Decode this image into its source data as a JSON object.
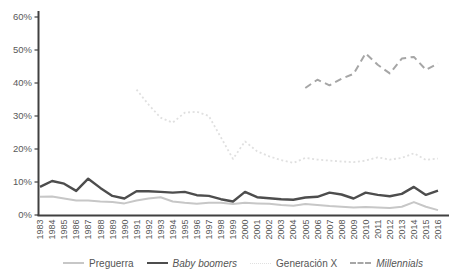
{
  "chart_data": {
    "type": "line",
    "title": "",
    "xlabel": "",
    "ylabel": "",
    "ylim": [
      0,
      60
    ],
    "grid": false,
    "legend_position": "bottom-center",
    "axis_color": "#404040",
    "tick_label_color": "#595959",
    "background": "#ffffff",
    "yticks": [
      "0%",
      "10%",
      "20%",
      "30%",
      "40%",
      "50%",
      "60%"
    ],
    "x": [
      1983,
      1984,
      1985,
      1986,
      1987,
      1988,
      1989,
      1990,
      1991,
      1992,
      1993,
      1994,
      1995,
      1996,
      1997,
      1998,
      1999,
      2000,
      2001,
      2002,
      2003,
      2004,
      2005,
      2006,
      2007,
      2008,
      2009,
      2010,
      2011,
      2012,
      2013,
      2014,
      2015,
      2016
    ],
    "series": [
      {
        "name": "Preguerra",
        "color": "#c7c7c7",
        "style": "solid",
        "width": 2,
        "italic": false,
        "values": [
          5.5,
          5.6,
          5.0,
          4.4,
          4.4,
          4.1,
          3.9,
          3.5,
          4.4,
          5.0,
          5.4,
          4.1,
          3.7,
          3.4,
          3.7,
          3.7,
          3.3,
          3.7,
          3.5,
          3.4,
          3.0,
          2.8,
          3.3,
          3.0,
          2.7,
          2.5,
          2.3,
          2.4,
          2.3,
          2.1,
          2.5,
          3.9,
          2.5,
          1.5
        ]
      },
      {
        "name": "Baby boomers",
        "color": "#4d4d4d",
        "style": "solid",
        "width": 2.4,
        "italic": true,
        "values": [
          8.5,
          10.3,
          9.5,
          7.3,
          11.0,
          8.2,
          5.8,
          5.0,
          7.2,
          7.2,
          7.0,
          6.8,
          7.0,
          6.0,
          5.8,
          4.8,
          4.1,
          7.0,
          5.4,
          5.1,
          4.8,
          4.6,
          5.3,
          5.5,
          6.8,
          6.2,
          5.0,
          6.8,
          6.1,
          5.7,
          6.4,
          8.5,
          6.1,
          7.4
        ]
      },
      {
        "name": "Generación X",
        "color": "#e0e0e0",
        "style": "dotted",
        "width": 1.8,
        "italic": false,
        "values": [
          null,
          null,
          null,
          null,
          null,
          null,
          null,
          null,
          38.0,
          33.5,
          29.5,
          28.0,
          31.0,
          31.3,
          30.0,
          23.5,
          17.0,
          22.3,
          19.3,
          17.8,
          16.6,
          15.8,
          17.3,
          16.8,
          16.5,
          16.2,
          16.0,
          16.5,
          17.5,
          16.8,
          17.3,
          18.7,
          16.7,
          17.1
        ]
      },
      {
        "name": "Millennials",
        "color": "#a6a6a6",
        "style": "dashed",
        "width": 2,
        "italic": true,
        "values": [
          null,
          null,
          null,
          null,
          null,
          null,
          null,
          null,
          null,
          null,
          null,
          null,
          null,
          null,
          null,
          null,
          null,
          null,
          null,
          null,
          null,
          null,
          38.5,
          41.0,
          39.3,
          41.3,
          42.8,
          49.0,
          45.5,
          42.9,
          47.4,
          47.9,
          44.0,
          45.9
        ]
      }
    ]
  }
}
